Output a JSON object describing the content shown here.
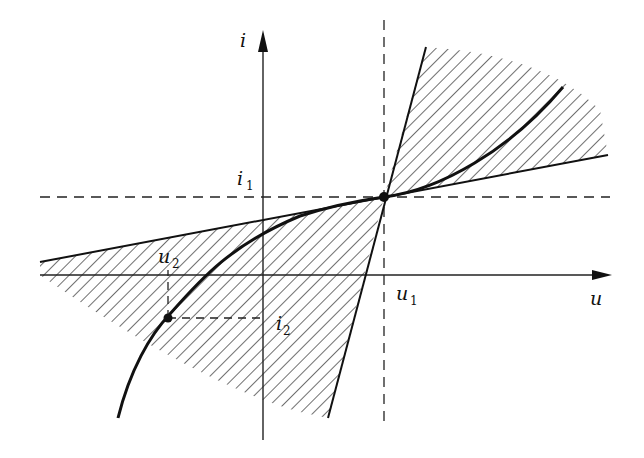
{
  "diagram": {
    "axes": {
      "x_label": "u",
      "y_label": "i"
    },
    "points": {
      "p1": {
        "u_label": "u",
        "u_sub": "1",
        "i_label": "i",
        "i_sub": "1"
      },
      "p2": {
        "u_label": "u",
        "u_sub": "2",
        "i_label": "i",
        "i_sub": "2"
      }
    },
    "colors": {
      "ink": "#111111",
      "background": "#ffffff"
    }
  }
}
